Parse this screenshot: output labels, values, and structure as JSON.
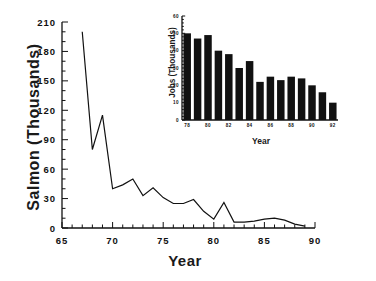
{
  "chart_data": [
    {
      "id": "main",
      "type": "line",
      "title": "",
      "xlabel": "Year",
      "ylabel": "Salmon  (Thousands)",
      "xlim": [
        65,
        90
      ],
      "ylim": [
        0,
        210
      ],
      "xticks": [
        65,
        70,
        75,
        80,
        85,
        90
      ],
      "yticks": [
        0,
        30,
        60,
        90,
        120,
        150,
        180,
        210
      ],
      "xtick_labels": [
        "65",
        "70",
        "75",
        "80",
        "85",
        "90"
      ],
      "ytick_labels": [
        "0",
        "30",
        "60",
        "90",
        "120",
        "150",
        "180",
        "210"
      ],
      "minor_xtick_interval": 1,
      "minor_ytick_interval": 10,
      "grid": false,
      "legend": false,
      "x": [
        67,
        68,
        69,
        70,
        71,
        72,
        73,
        74,
        75,
        76,
        77,
        78,
        79,
        80,
        81,
        82,
        83,
        84,
        85,
        86,
        87,
        88,
        89
      ],
      "values": [
        200,
        80,
        115,
        40,
        44,
        50,
        33,
        41,
        31,
        25,
        25,
        29,
        17,
        9,
        26,
        6,
        6,
        7,
        9,
        10,
        8,
        4,
        2
      ]
    },
    {
      "id": "inset",
      "type": "bar",
      "title": "",
      "xlabel": "Year",
      "ylabel": "Jobs  (Thousands)",
      "xlim": [
        77.5,
        92.5
      ],
      "ylim": [
        0,
        60
      ],
      "yticks": [
        0,
        10,
        20,
        30,
        40,
        50,
        60
      ],
      "ytick_labels": [
        "0",
        "10",
        "20",
        "30",
        "40",
        "50",
        "60"
      ],
      "xticks": [
        78,
        80,
        82,
        84,
        86,
        88,
        90,
        92
      ],
      "xtick_labels": [
        "78",
        "80",
        "82",
        "84",
        "86",
        "88",
        "90",
        "92"
      ],
      "grid": false,
      "legend": false,
      "categories": [
        "78",
        "79",
        "80",
        "81",
        "82",
        "83",
        "84",
        "85",
        "86",
        "87",
        "88",
        "89",
        "90",
        "91",
        "92"
      ],
      "values": [
        50,
        47,
        49,
        40,
        38,
        30,
        34,
        22,
        25,
        23,
        25,
        24,
        20,
        16,
        10
      ]
    }
  ],
  "labels": {
    "main_ylabel": "Salmon  (Thousands)",
    "main_xlabel": "Year",
    "inset_ylabel": "Jobs  (Thousands)",
    "inset_xlabel": "Year"
  }
}
